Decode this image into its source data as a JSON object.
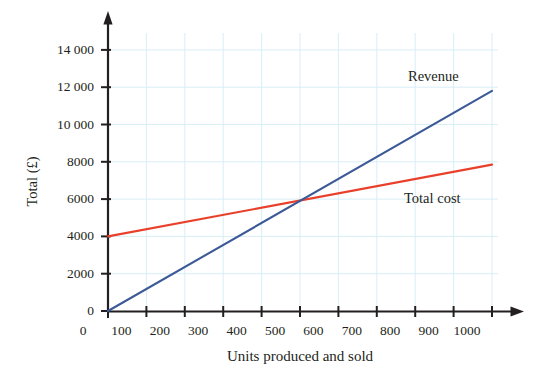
{
  "chart_data": {
    "type": "line",
    "title": "",
    "xlabel": "Units produced and sold",
    "ylabel": "Total (£)",
    "xlim": [
      0,
      1000
    ],
    "ylim": [
      0,
      15000
    ],
    "grid": true,
    "legend_position": "inline-right",
    "x_ticks": [
      {
        "value": 0,
        "label": "0"
      },
      {
        "value": 100,
        "label": "100"
      },
      {
        "value": 200,
        "label": "200"
      },
      {
        "value": 300,
        "label": "300"
      },
      {
        "value": 400,
        "label": "400"
      },
      {
        "value": 500,
        "label": "500"
      },
      {
        "value": 600,
        "label": "600"
      },
      {
        "value": 700,
        "label": "700"
      },
      {
        "value": 800,
        "label": "800"
      },
      {
        "value": 900,
        "label": "900"
      },
      {
        "value": 1000,
        "label": "1000"
      }
    ],
    "y_ticks": [
      {
        "value": 0,
        "label": "0"
      },
      {
        "value": 2000,
        "label": "2000"
      },
      {
        "value": 4000,
        "label": "4000"
      },
      {
        "value": 6000,
        "label": "6000"
      },
      {
        "value": 8000,
        "label": "8000"
      },
      {
        "value": 10000,
        "label": "10 000"
      },
      {
        "value": 12000,
        "label": "12 000"
      },
      {
        "value": 14000,
        "label": "14 000"
      }
    ],
    "series": [
      {
        "name": "Revenue",
        "color": "#3d5a98",
        "label_text": "Revenue",
        "x": [
          0,
          1000
        ],
        "values": [
          0,
          11800
        ]
      },
      {
        "name": "Total cost",
        "color": "#e8402a",
        "label_text": "Total cost",
        "x": [
          0,
          1000
        ],
        "values": [
          4000,
          7850
        ]
      }
    ],
    "intersection": {
      "x": 500,
      "y": 5900
    },
    "grid_color": "#d7eef7",
    "axis_color": "#231f20"
  },
  "labels": {
    "revenue": "Revenue",
    "total_cost": "Total cost"
  }
}
